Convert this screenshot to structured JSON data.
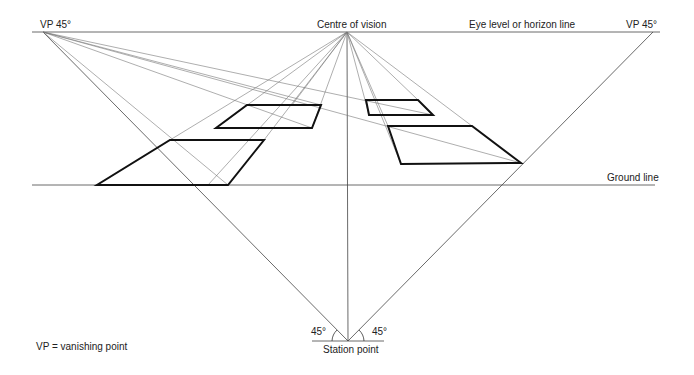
{
  "labels": {
    "vp_left": "VP 45°",
    "vp_right": "VP 45°",
    "centre_of_vision": "Centre of vision",
    "horizon": "Eye level or horizon line",
    "ground_line": "Ground line",
    "station_point": "Station point",
    "angle_left": "45°",
    "angle_right": "45°",
    "legend": "VP = vanishing point"
  },
  "geometry": {
    "horizon_y": 32,
    "ground_y": 185,
    "vp_left": [
      43,
      32
    ],
    "vp_right": [
      653,
      32
    ],
    "centre_of_vision": [
      347,
      32
    ],
    "station_point": [
      348,
      341
    ]
  },
  "quads": [
    {
      "name": "large-left-square",
      "points": "97,185 228,185 264,140 170,140"
    },
    {
      "name": "small-left-square",
      "points": "216,128 312,128 321,105 247,105"
    },
    {
      "name": "small-right-square",
      "points": "366,100 418,100 433,115 369,115"
    },
    {
      "name": "large-right-square",
      "points": "388,126 472,126 521,163 401,164"
    }
  ],
  "colors": {
    "line": "#555555",
    "quad": "#111111",
    "text": "#222222"
  }
}
